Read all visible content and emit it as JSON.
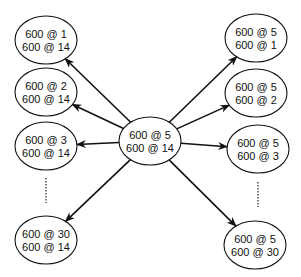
{
  "diagram": {
    "center": {
      "id": "center",
      "line1": "600 @ 5",
      "line2": "600 @ 14"
    },
    "left_nodes": [
      {
        "id": "left-1",
        "line1": "600 @ 1",
        "line2": "600 @ 14"
      },
      {
        "id": "left-2",
        "line1": "600 @ 2",
        "line2": "600 @ 14"
      },
      {
        "id": "left-3",
        "line1": "600 @ 3",
        "line2": "600 @ 14"
      },
      {
        "id": "left-30",
        "line1": "600 @ 30",
        "line2": "600 @ 14"
      }
    ],
    "right_nodes": [
      {
        "id": "right-1",
        "line1": "600 @ 5",
        "line2": "600 @ 1"
      },
      {
        "id": "right-2",
        "line1": "600 @ 5",
        "line2": "600 @ 2"
      },
      {
        "id": "right-3",
        "line1": "600 @ 5",
        "line2": "600 @ 3"
      },
      {
        "id": "right-30",
        "line1": "600 @ 5",
        "line2": "600 @ 30"
      }
    ],
    "edges": [
      {
        "from": "center",
        "to": "left-1"
      },
      {
        "from": "center",
        "to": "left-2"
      },
      {
        "from": "center",
        "to": "left-3"
      },
      {
        "from": "center",
        "to": "left-30"
      },
      {
        "from": "center",
        "to": "right-1"
      },
      {
        "from": "center",
        "to": "right-2"
      },
      {
        "from": "center",
        "to": "right-3"
      },
      {
        "from": "center",
        "to": "right-30"
      }
    ],
    "ellipsis_markers": [
      "left-column",
      "right-column"
    ]
  }
}
